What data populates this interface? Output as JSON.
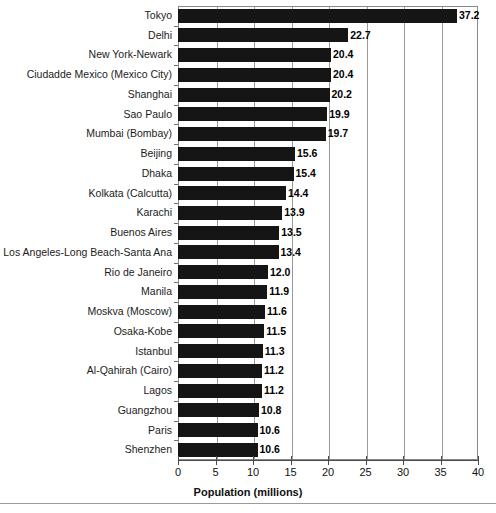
{
  "chart_data": {
    "type": "bar",
    "orientation": "horizontal",
    "title": "",
    "xlabel": "Population (millions)",
    "ylabel": "",
    "xlim": [
      0,
      40
    ],
    "xticks": [
      0,
      5,
      10,
      15,
      20,
      25,
      30,
      35,
      40
    ],
    "xtick_labels": [
      "0",
      "5",
      "10",
      "15",
      "20",
      "25",
      "30",
      "35",
      "40"
    ],
    "grid": "vertical",
    "legend": "none",
    "bar_color": "#151515",
    "value_labels": true,
    "categories": [
      "Tokyo",
      "Delhi",
      "New York-Newark",
      "Ciudadde Mexico (Mexico City)",
      "Shanghai",
      "Sao Paulo",
      "Mumbai (Bombay)",
      "Beijing",
      "Dhaka",
      "Kolkata (Calcutta)",
      "Karachi",
      "Buenos Aires",
      "Los Angeles-Long Beach-Santa Ana",
      "Rio de Janeiro",
      "Manila",
      "Moskva (Moscow)",
      "Osaka-Kobe",
      "Istanbul",
      "Al-Qahirah (Cairo)",
      "Lagos",
      "Guangzhou",
      "Paris",
      "Shenzhen"
    ],
    "values": [
      37.2,
      22.7,
      20.4,
      20.4,
      20.2,
      19.9,
      19.7,
      15.6,
      15.4,
      14.4,
      13.9,
      13.5,
      13.4,
      12.0,
      11.9,
      11.6,
      11.5,
      11.3,
      11.2,
      11.2,
      10.8,
      10.6,
      10.6
    ],
    "value_label_text": [
      "37.2",
      "22.7",
      "20.4",
      "20.4",
      "20.2",
      "19.9",
      "19.7",
      "15.6",
      "15.4",
      "14.4",
      "13.9",
      "13.5",
      "13.4",
      "12.0",
      "11.9",
      "11.6",
      "11.5",
      "11.3",
      "11.2",
      "11.2",
      "10.8",
      "10.6",
      "10.6"
    ]
  }
}
